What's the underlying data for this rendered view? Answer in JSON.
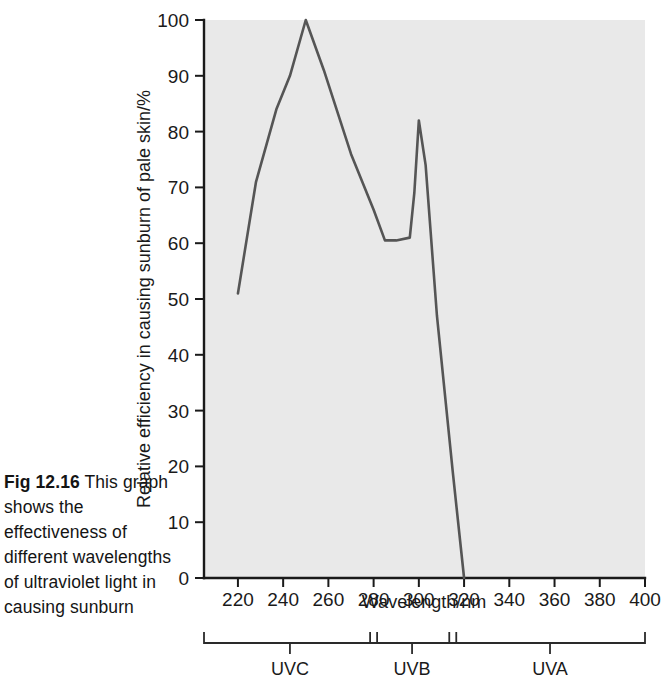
{
  "figure": {
    "caption_number": "Fig 12.16",
    "caption_text": "This graph shows the effectiveness of different wavelengths of ultraviolet light in causing sunburn"
  },
  "chart_data": {
    "type": "line",
    "title": "",
    "xlabel": "Wavelength/nm",
    "ylabel": "Relative efficiency in causing sunburn of pale skin/%",
    "xlim": [
      205,
      400
    ],
    "ylim": [
      0,
      100
    ],
    "xticks": [
      220,
      240,
      260,
      280,
      300,
      320,
      340,
      360,
      380,
      400
    ],
    "yticks": [
      0,
      10,
      20,
      30,
      40,
      50,
      60,
      70,
      80,
      90,
      100
    ],
    "xtick_labels": [
      "220",
      "240",
      "260",
      "280",
      "300",
      "320",
      "340",
      "360",
      "380",
      "400"
    ],
    "ytick_labels": [
      "0",
      "10",
      "20",
      "30",
      "40",
      "50",
      "60",
      "70",
      "80",
      "90",
      "100"
    ],
    "grid": false,
    "legend": false,
    "plot_background": "#e9e9e9",
    "line_color": "#555555",
    "series": [
      {
        "name": "Relative sunburn efficiency",
        "x": [
          220,
          228,
          237,
          243,
          250,
          258,
          270,
          280,
          285,
          290,
          296,
          298,
          300,
          303,
          308,
          315,
          320
        ],
        "y": [
          51,
          71,
          84,
          90,
          100,
          91,
          76,
          66,
          60.5,
          60.5,
          61,
          69,
          82,
          74,
          47,
          19,
          0
        ]
      }
    ],
    "annotations": {
      "uv_bands": [
        {
          "label": "UVC",
          "range_nm": [
            205,
            280
          ],
          "tick_nm": 243
        },
        {
          "label": "UVB",
          "range_nm": [
            280,
            315
          ],
          "tick_nm": 297
        },
        {
          "label": "UVA",
          "range_nm": [
            315,
            400
          ],
          "tick_nm": 358
        }
      ],
      "band_break_nm": [
        280,
        315
      ]
    }
  }
}
